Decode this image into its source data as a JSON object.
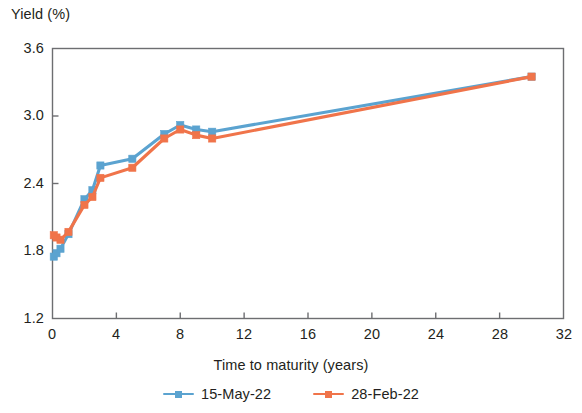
{
  "chart_data": {
    "type": "line",
    "title": "",
    "subtitle": "",
    "xlabel": "Time to maturity (years)",
    "ylabel": "Yield (%)",
    "xlim": [
      0,
      32
    ],
    "ylim": [
      1.2,
      3.6
    ],
    "xticks": [
      "0",
      "4",
      "8",
      "12",
      "16",
      "20",
      "24",
      "28",
      "32"
    ],
    "xtick_values": [
      0,
      4,
      8,
      12,
      16,
      20,
      24,
      28,
      32
    ],
    "yticks": [
      "1.2",
      "1.8",
      "2.4",
      "3.0",
      "3.6"
    ],
    "ytick_values": [
      1.2,
      1.8,
      2.4,
      3.0,
      3.6
    ],
    "grid": false,
    "legend_position": "bottom-center",
    "marker": "square",
    "series": [
      {
        "name": "15-May-22",
        "color": "#5BA3D0",
        "x": [
          0.08,
          0.25,
          0.5,
          1,
          2,
          2.5,
          3,
          5,
          7,
          8,
          9,
          10,
          30
        ],
        "values": [
          1.75,
          1.78,
          1.82,
          1.95,
          2.26,
          2.34,
          2.56,
          2.62,
          2.84,
          2.92,
          2.88,
          2.86,
          3.35
        ]
      },
      {
        "name": "28-Feb-22",
        "color": "#F0744A",
        "x": [
          0.08,
          0.25,
          0.5,
          1,
          2,
          2.5,
          3,
          5,
          7,
          8,
          9,
          10,
          30
        ],
        "values": [
          1.94,
          1.92,
          1.9,
          1.97,
          2.21,
          2.28,
          2.45,
          2.54,
          2.8,
          2.88,
          2.83,
          2.8,
          3.35
        ]
      }
    ]
  },
  "legend": {
    "items": [
      {
        "label": "15-May-22",
        "color": "#5BA3D0"
      },
      {
        "label": "28-Feb-22",
        "color": "#F0744A"
      }
    ]
  },
  "axes": {
    "frame_color": "#6d6e71"
  }
}
